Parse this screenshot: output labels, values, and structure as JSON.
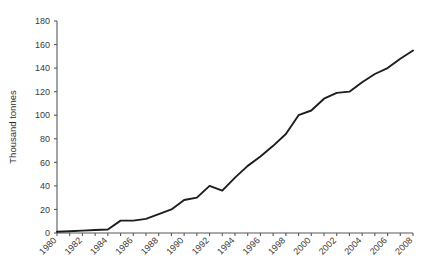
{
  "chart_data": {
    "type": "line",
    "title": "",
    "xlabel": "",
    "ylabel": "Thousand tonnes",
    "xlim": [
      1980,
      2008
    ],
    "ylim": [
      0,
      180
    ],
    "y_ticks": [
      0,
      20,
      40,
      60,
      80,
      100,
      120,
      140,
      160,
      180
    ],
    "x_tick_labels": [
      "1980",
      "1982",
      "1984",
      "1986",
      "1988",
      "1990",
      "1992",
      "1994",
      "1996",
      "1998",
      "2000",
      "2002",
      "2004",
      "2006",
      "2008"
    ],
    "x_tick_step_labeled": 2,
    "x_tick_step_minor": 1,
    "grid": false,
    "legend": false,
    "legend_position": "none",
    "line_color": "#1d1d1f",
    "axis_color": "#58585a",
    "background_color": "#ffffff",
    "x": [
      1980,
      1981,
      1982,
      1983,
      1984,
      1985,
      1986,
      1987,
      1988,
      1989,
      1990,
      1991,
      1992,
      1993,
      1994,
      1995,
      1996,
      1997,
      1998,
      1999,
      2000,
      2001,
      2002,
      2003,
      2004,
      2005,
      2006,
      2007,
      2008
    ],
    "values": [
      1,
      1.5,
      2,
      2.5,
      3,
      10.5,
      10.5,
      12,
      16,
      20,
      28,
      30,
      40,
      36,
      47,
      57,
      65,
      74,
      84,
      100,
      104,
      114,
      119,
      120,
      128,
      135,
      140,
      148,
      155
    ],
    "series": [
      {
        "name": "Thousand tonnes",
        "values": [
          1,
          1.5,
          2,
          2.5,
          3,
          10.5,
          10.5,
          12,
          16,
          20,
          28,
          30,
          40,
          36,
          47,
          57,
          65,
          74,
          84,
          100,
          104,
          114,
          119,
          120,
          128,
          135,
          140,
          148,
          155
        ]
      }
    ],
    "points": [
      {
        "year": 1980,
        "value": 1
      },
      {
        "year": 1981,
        "value": 1.5
      },
      {
        "year": 1982,
        "value": 2
      },
      {
        "year": 1983,
        "value": 2.5
      },
      {
        "year": 1984,
        "value": 3
      },
      {
        "year": 1985,
        "value": 10.5
      },
      {
        "year": 1986,
        "value": 10.5
      },
      {
        "year": 1987,
        "value": 12
      },
      {
        "year": 1988,
        "value": 16
      },
      {
        "year": 1989,
        "value": 20
      },
      {
        "year": 1990,
        "value": 28
      },
      {
        "year": 1991,
        "value": 30
      },
      {
        "year": 1992,
        "value": 40
      },
      {
        "year": 1993,
        "value": 36
      },
      {
        "year": 1994,
        "value": 47
      },
      {
        "year": 1995,
        "value": 57
      },
      {
        "year": 1996,
        "value": 65
      },
      {
        "year": 1997,
        "value": 74
      },
      {
        "year": 1998,
        "value": 84
      },
      {
        "year": 1999,
        "value": 100
      },
      {
        "year": 2000,
        "value": 104
      },
      {
        "year": 2001,
        "value": 114
      },
      {
        "year": 2002,
        "value": 119
      },
      {
        "year": 2003,
        "value": 120
      },
      {
        "year": 2004,
        "value": 128
      },
      {
        "year": 2005,
        "value": 135
      },
      {
        "year": 2006,
        "value": 140
      },
      {
        "year": 2007,
        "value": 148
      },
      {
        "year": 2008,
        "value": 155
      }
    ]
  }
}
